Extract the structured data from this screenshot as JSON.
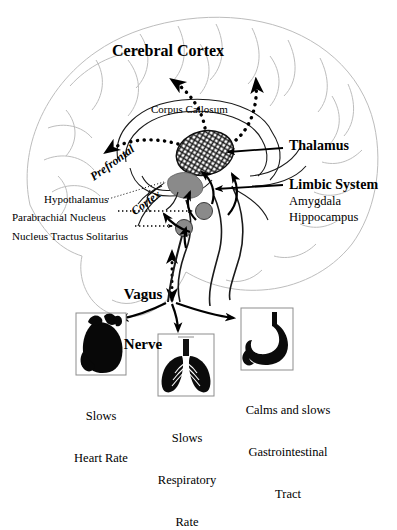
{
  "figure": {
    "background_color": "#ffffff",
    "ink_color": "#000000",
    "brain_outline_color": "#b9b9b9",
    "nucleus_fill_color": "#8a8a8a",
    "hypothalamus_fill_color": "#8a8a8a"
  },
  "brain_labels": {
    "cerebral_cortex": "Cerebral Cortex",
    "corpus_callosum": "Corpus Callosum",
    "prefrontal_line1": "Prefrontal",
    "prefrontal_line2": "Cortex",
    "thalamus": "Thalamus",
    "limbic_system": "Limbic System",
    "amygdala": "Amygdala",
    "hippocampus": "Hippocampus",
    "hypothalamus": "Hypothalamus",
    "parabrachial_nucleus": "Parabrachial Nucleus",
    "nucleus_tractus_solitarius": "Nucleus Tractus Solitarius",
    "vagus_line1": "Vagus",
    "vagus_line2": "Nerve"
  },
  "organs": [
    {
      "id": "heart",
      "icon": "heart-silhouette-icon",
      "caption_line1": "Slows",
      "caption_line2": "Heart Rate",
      "caption_line3": ""
    },
    {
      "id": "lungs",
      "icon": "lungs-silhouette-icon",
      "caption_line1": "Slows",
      "caption_line2": "Respiratory",
      "caption_line3": "Rate"
    },
    {
      "id": "stomach",
      "icon": "stomach-silhouette-icon",
      "caption_line1": "Calms and slows",
      "caption_line2": "Gastrointestinal",
      "caption_line3": "Tract"
    }
  ]
}
